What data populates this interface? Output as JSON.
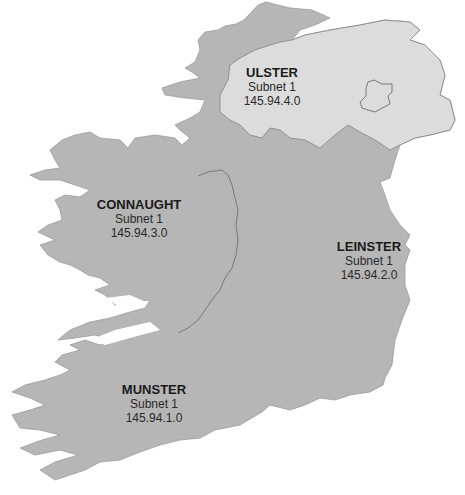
{
  "map": {
    "title": "Ireland provinces subnet map",
    "colors": {
      "land": "#b6b6b6",
      "northern_ireland": "#dcdcdc",
      "border": "#7a7a7a",
      "water": "#ffffff",
      "text": "#1a1a1a"
    },
    "regions": [
      {
        "name": "ULSTER",
        "subnet": "Subnet 1",
        "ip": "145.94.4.0"
      },
      {
        "name": "CONNAUGHT",
        "subnet": "Subnet 1",
        "ip": "145.94.3.0"
      },
      {
        "name": "LEINSTER",
        "subnet": "Subnet 1",
        "ip": "145.94.2.0"
      },
      {
        "name": "MUNSTER",
        "subnet": "Subnet 1",
        "ip": "145.94.1.0"
      }
    ],
    "features": [
      "lough-neagh",
      "river-shannon",
      "northern-ireland-border"
    ]
  }
}
